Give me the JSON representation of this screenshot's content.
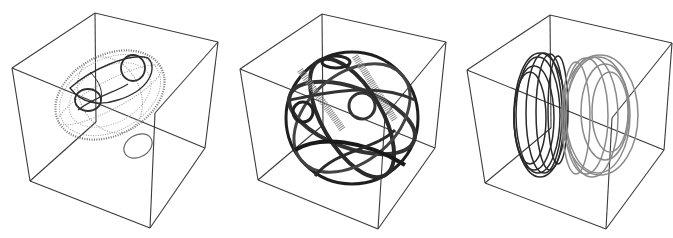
{
  "figure": {
    "panel_count": 3,
    "panels": [
      {
        "id": "left",
        "description": "3D bounding box containing a dotted ellipsoid shell with darker looped trajectory curves on its upper surface and a small separate ellipse below the shell",
        "curve_color": "#555555",
        "dominant_shade": "light-gray dotted"
      },
      {
        "id": "middle",
        "description": "3D bounding box containing a sphere densely wrapped by dark tube-like looping trajectories",
        "curve_color": "#222222",
        "dominant_shade": "dark"
      },
      {
        "id": "right",
        "description": "3D bounding box containing a sphere of stacked parallel circular bands, dark on the left half and lighter gray on the right half",
        "curve_color_left": "#2a2a2a",
        "curve_color_right": "#8a8a8a",
        "dominant_shade": "dark-to-gray"
      }
    ],
    "box_color": "#3a3a3a",
    "background": "#ffffff"
  }
}
